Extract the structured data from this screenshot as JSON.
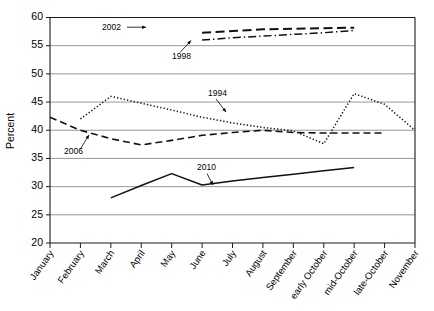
{
  "chart_data": {
    "type": "line",
    "title": "",
    "subtitle": "",
    "xlabel": "",
    "ylabel": "Percent",
    "ylim": [
      20,
      60
    ],
    "ytick_step": 5,
    "yticks": [
      20,
      25,
      30,
      35,
      40,
      45,
      50,
      55,
      60
    ],
    "grid": true,
    "legend": "none (inline annotations)",
    "categories": [
      "January",
      "February",
      "March",
      "April",
      "May",
      "June",
      "July",
      "August",
      "September",
      "early October",
      "mid-October",
      "late-October",
      "November"
    ],
    "series": [
      {
        "name": "2002",
        "style": "long-dash",
        "annotation": "2002",
        "values": [
          null,
          null,
          null,
          null,
          null,
          57.3,
          57.6,
          57.9,
          58.0,
          58.1,
          58.2,
          null,
          null
        ]
      },
      {
        "name": "1998",
        "style": "dash-dot",
        "annotation": "1998",
        "values": [
          null,
          null,
          null,
          null,
          null,
          56.0,
          56.4,
          56.7,
          57.0,
          57.3,
          57.7,
          null,
          null
        ]
      },
      {
        "name": "1994",
        "style": "dotted",
        "annotation": "1994",
        "values": [
          null,
          42.0,
          46.0,
          44.8,
          43.6,
          42.3,
          41.3,
          40.5,
          39.9,
          37.6,
          46.5,
          44.6,
          40.0
        ]
      },
      {
        "name": "2006",
        "style": "dashed",
        "annotation": "2006",
        "values": [
          42.3,
          40.0,
          38.5,
          37.4,
          38.2,
          39.1,
          39.6,
          40.0,
          39.6,
          39.5,
          39.5,
          39.5,
          null
        ]
      },
      {
        "name": "2010",
        "style": "solid",
        "annotation": "2010",
        "values": [
          null,
          null,
          28.0,
          30.2,
          32.3,
          30.3,
          31.0,
          31.6,
          32.2,
          32.8,
          33.4,
          null,
          null
        ]
      }
    ],
    "annotations": [
      {
        "label": "2002",
        "series": "2002",
        "position": "left-of-line-with-arrow"
      },
      {
        "label": "1998",
        "series": "1998",
        "position": "below-line-with-leader"
      },
      {
        "label": "1994",
        "series": "1994",
        "position": "above-line-with-arrow"
      },
      {
        "label": "2006",
        "series": "2006",
        "position": "below-line-with-leader"
      },
      {
        "label": "2010",
        "series": "2010",
        "position": "above-line-with-arrow"
      }
    ]
  }
}
